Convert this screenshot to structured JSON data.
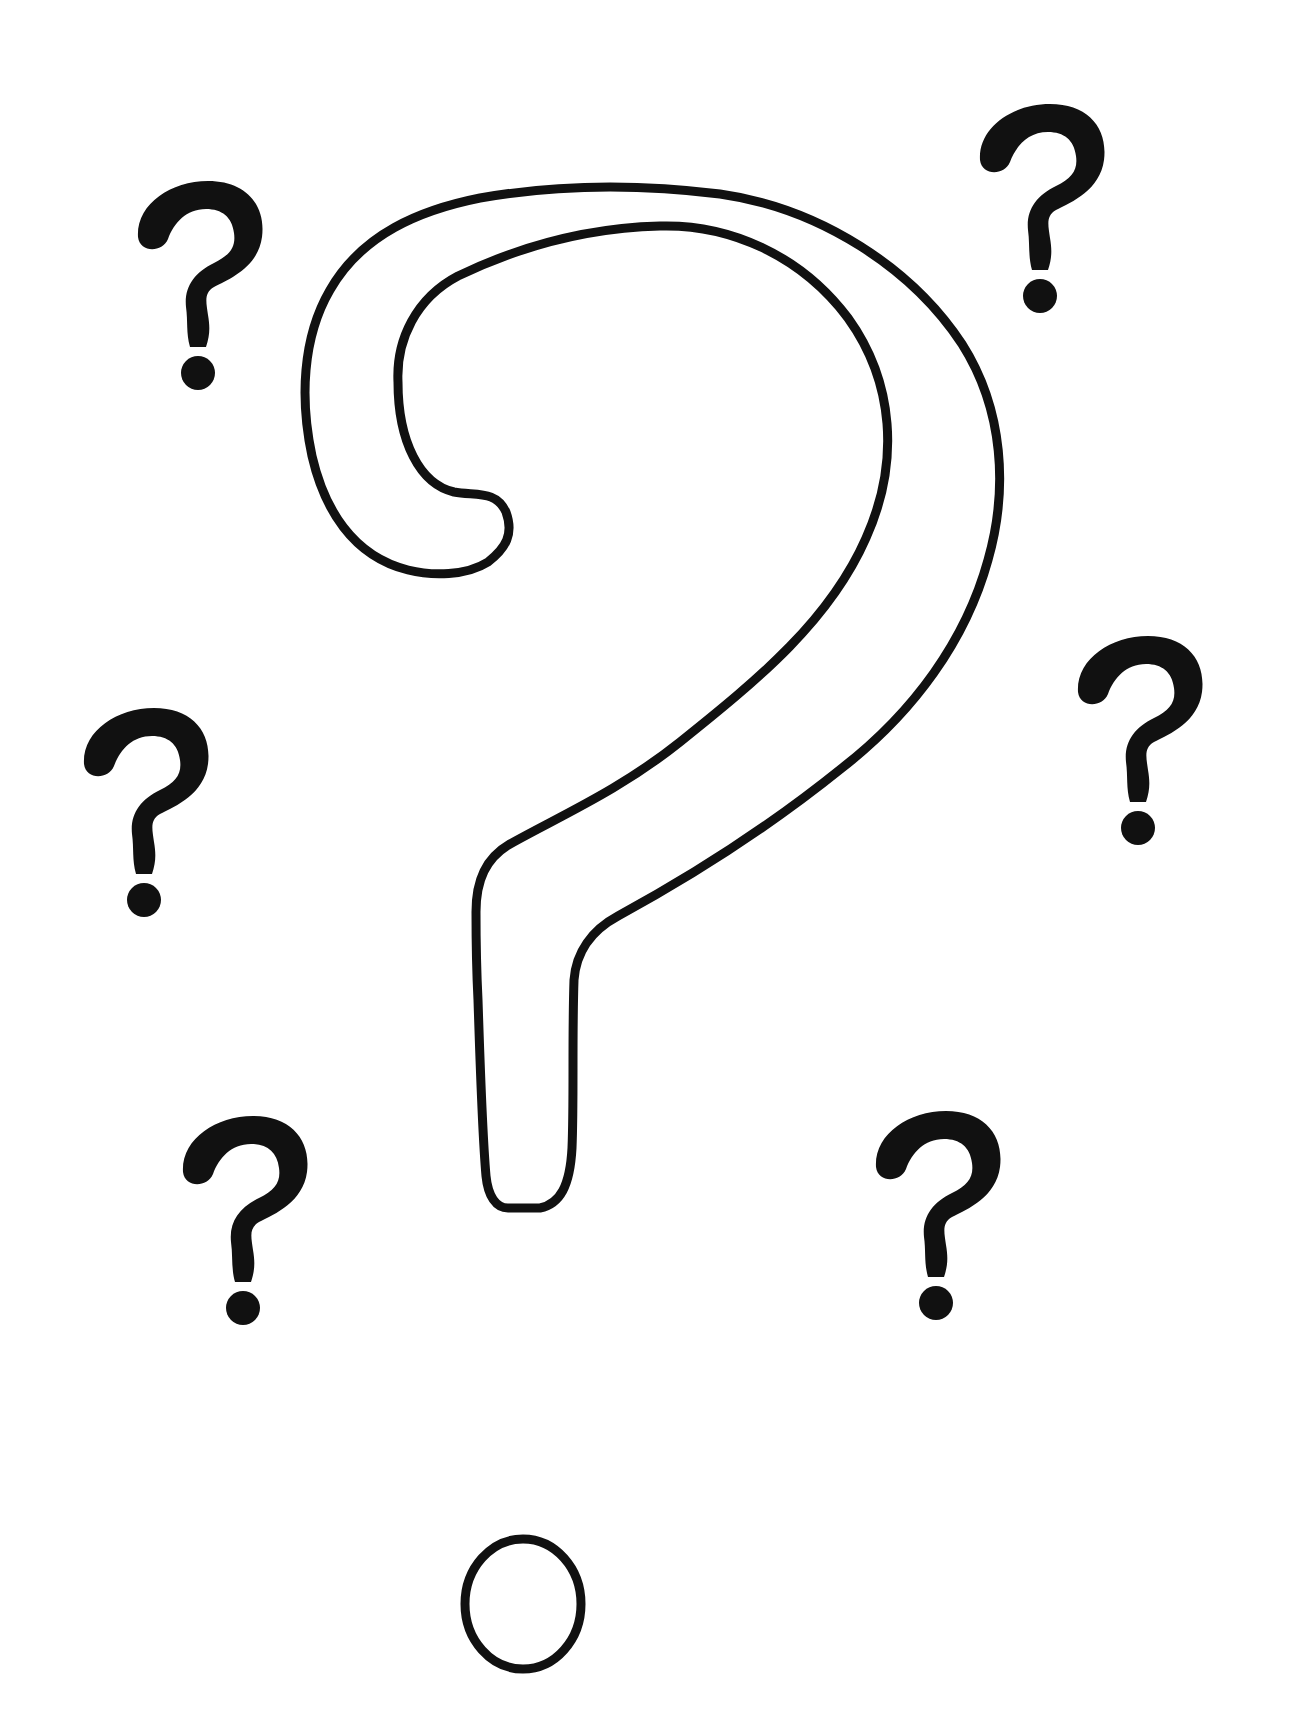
{
  "illustration": {
    "subject": "question marks",
    "ink_color": "#111111",
    "background_color": "#ffffff",
    "large_mark": {
      "style": "outline",
      "label": "large outlined question mark"
    },
    "small_marks": [
      {
        "id": "top-left",
        "label": "small question mark top left"
      },
      {
        "id": "top-right",
        "label": "small question mark top right"
      },
      {
        "id": "middle-left",
        "label": "small question mark middle left"
      },
      {
        "id": "middle-right",
        "label": "small question mark middle right"
      },
      {
        "id": "bottom-left",
        "label": "small question mark bottom left"
      },
      {
        "id": "bottom-right",
        "label": "small question mark bottom right"
      }
    ]
  }
}
